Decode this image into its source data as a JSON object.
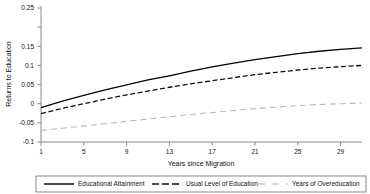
{
  "chart_data": {
    "type": "line",
    "title": "",
    "xlabel": "Years since Migration",
    "ylabel": "Returns to Education",
    "xlim": [
      1,
      31
    ],
    "ylim": [
      -0.1,
      0.25
    ],
    "grid": false,
    "legend_position": "bottom",
    "x_tick_labels": [
      "1",
      "5",
      "9",
      "13",
      "17",
      "21",
      "25",
      "29"
    ],
    "x_ticks": [
      1,
      5,
      9,
      13,
      17,
      21,
      25,
      29
    ],
    "y_tick_labels": [
      "0.25",
      "0.15",
      "0.1",
      "0.05",
      "0",
      "-0.05",
      "-0.1"
    ],
    "y_ticks": [
      0.25,
      0.15,
      0.1,
      0.05,
      0,
      -0.05,
      -0.1
    ],
    "x": [
      1,
      3,
      5,
      7,
      9,
      11,
      13,
      15,
      17,
      19,
      21,
      23,
      25,
      27,
      29,
      31
    ],
    "series": [
      {
        "name": "Educational Attainment",
        "style": "solid",
        "color": "#000000",
        "values": [
          -0.01,
          0.007,
          0.022,
          0.036,
          0.049,
          0.062,
          0.073,
          0.085,
          0.096,
          0.106,
          0.115,
          0.123,
          0.131,
          0.137,
          0.142,
          0.146
        ]
      },
      {
        "name": "Usual Level of Education",
        "style": "dashed",
        "color": "#111111",
        "values": [
          -0.026,
          -0.012,
          0.0,
          0.012,
          0.023,
          0.033,
          0.043,
          0.052,
          0.06,
          0.068,
          0.076,
          0.082,
          0.088,
          0.093,
          0.097,
          0.1
        ]
      },
      {
        "name": "Years of Overeducation",
        "style": "long-dashed",
        "color": "#b8b8b8",
        "values": [
          -0.07,
          -0.064,
          -0.058,
          -0.052,
          -0.046,
          -0.04,
          -0.034,
          -0.028,
          -0.023,
          -0.018,
          -0.013,
          -0.009,
          -0.005,
          -0.002,
          0.0,
          0.002
        ]
      }
    ]
  },
  "axis": {
    "x_title": "Years since Migration",
    "y_title": "Returns to Education",
    "y_labels": {
      "t0": "0.25",
      "t1": "0.15",
      "t2": "0.1",
      "t3": "0.05",
      "t4": "0",
      "t5": "-0.05",
      "t6": "-0.1"
    },
    "x_labels": {
      "t0": "1",
      "t1": "5",
      "t2": "9",
      "t3": "13",
      "t4": "17",
      "t5": "21",
      "t6": "25",
      "t7": "29"
    }
  },
  "legend": {
    "items": [
      {
        "label": "Educational Attainment",
        "style": "solid",
        "color": "#000000"
      },
      {
        "label": "Usual Level of Education",
        "style": "dashed",
        "color": "#111111"
      },
      {
        "label": "Years of Overeducation",
        "style": "long-dashed",
        "color": "#b8b8b8"
      }
    ]
  }
}
